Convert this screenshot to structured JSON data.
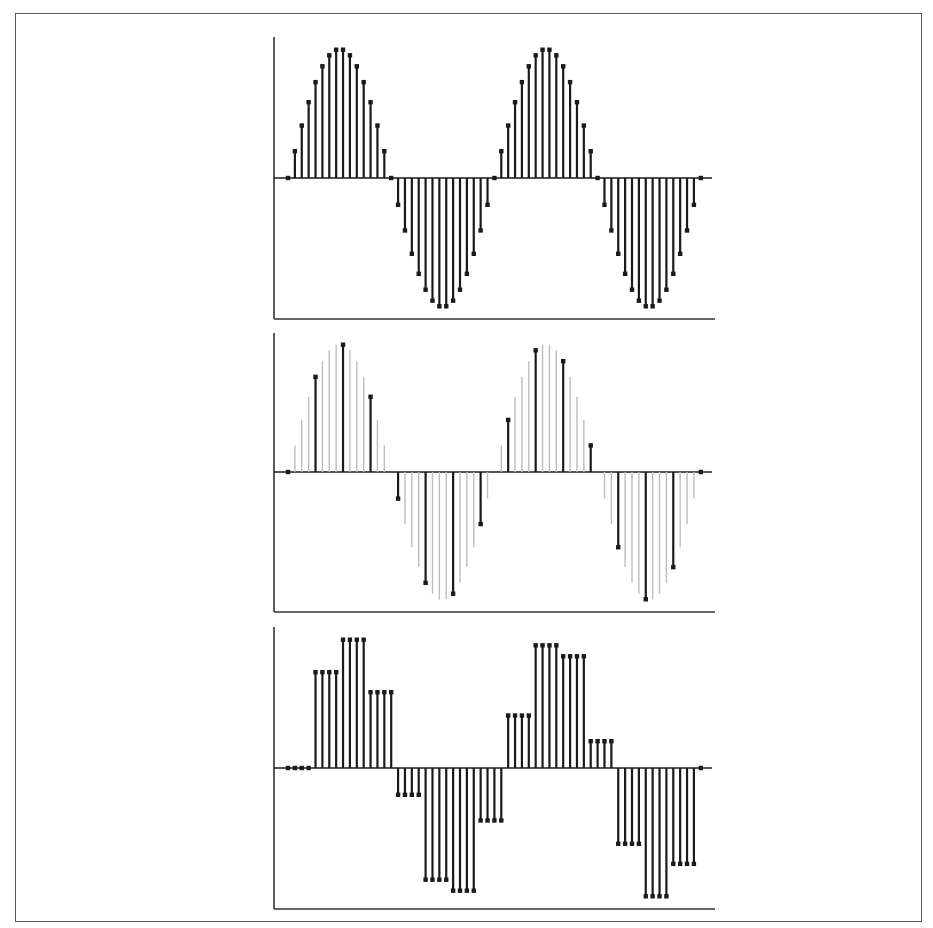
{
  "style": {
    "stem_color": "#1a1a1a",
    "ghost_color": "#bdbdbd",
    "axis_color": "#333333",
    "frame_color": "#555555"
  },
  "chart_data": [
    {
      "type": "stem",
      "title": "",
      "xlabel": "",
      "ylabel": "",
      "x_range": [
        0,
        60
      ],
      "ylim": [
        -1,
        1
      ],
      "samples_per_period": 30,
      "n_samples": 61,
      "formula": "sin(2*pi*n/30)",
      "values": [
        0,
        0.2079,
        0.4067,
        0.5878,
        0.7431,
        0.866,
        0.9511,
        0.9945,
        0.9945,
        0.9511,
        0.866,
        0.7431,
        0.5878,
        0.4067,
        0.2079,
        0,
        -0.2079,
        -0.4067,
        -0.5878,
        -0.7431,
        -0.866,
        -0.9511,
        -0.9945,
        -0.9945,
        -0.9511,
        -0.866,
        -0.7431,
        -0.5878,
        -0.4067,
        -0.2079,
        0,
        0.2079,
        0.4067,
        0.5878,
        0.7431,
        0.866,
        0.9511,
        0.9945,
        0.9945,
        0.9511,
        0.866,
        0.7431,
        0.5878,
        0.4067,
        0.2079,
        0,
        -0.2079,
        -0.4067,
        -0.5878,
        -0.7431,
        -0.866,
        -0.9511,
        -0.9945,
        -0.9945,
        -0.9511,
        -0.866,
        -0.7431,
        -0.5878,
        -0.4067,
        -0.2079,
        0
      ]
    },
    {
      "type": "stem",
      "title": "",
      "xlabel": "",
      "ylabel": "",
      "x_range": [
        0,
        60
      ],
      "ylim": [
        -1,
        1
      ],
      "downsample_factor": 4,
      "background_series": "original samples (light gray)",
      "highlighted_indices": [
        0,
        4,
        8,
        12,
        16,
        20,
        24,
        28,
        32,
        36,
        40,
        44,
        48,
        52,
        56,
        60
      ],
      "highlighted_values": [
        0,
        0.7431,
        0.9945,
        0.5878,
        -0.2079,
        -0.866,
        -0.9511,
        -0.4067,
        0.4067,
        0.9511,
        0.866,
        0.2079,
        -0.5878,
        -0.9945,
        -0.7431,
        0
      ]
    },
    {
      "type": "stem",
      "title": "",
      "xlabel": "",
      "ylabel": "",
      "x_range": [
        0,
        60
      ],
      "ylim": [
        -1,
        1
      ],
      "hold_length": 4,
      "values": [
        0,
        0,
        0,
        0,
        0.7431,
        0.7431,
        0.7431,
        0.7431,
        0.9945,
        0.9945,
        0.9945,
        0.9945,
        0.5878,
        0.5878,
        0.5878,
        0.5878,
        -0.2079,
        -0.2079,
        -0.2079,
        -0.2079,
        -0.866,
        -0.866,
        -0.866,
        -0.866,
        -0.9511,
        -0.9511,
        -0.9511,
        -0.9511,
        -0.4067,
        -0.4067,
        -0.4067,
        -0.4067,
        0.4067,
        0.4067,
        0.4067,
        0.4067,
        0.9511,
        0.9511,
        0.9511,
        0.9511,
        0.866,
        0.866,
        0.866,
        0.866,
        0.2079,
        0.2079,
        0.2079,
        0.2079,
        -0.5878,
        -0.5878,
        -0.5878,
        -0.5878,
        -0.9945,
        -0.9945,
        -0.9945,
        -0.9945,
        -0.7431,
        -0.7431,
        -0.7431,
        -0.7431,
        0
      ]
    }
  ],
  "layout": {
    "panels": [
      {
        "axis_left": 274,
        "axis_top": 37,
        "axis_bottom": 319,
        "axis_right": 715,
        "baseline_y": 178,
        "baseline_right": 712,
        "amplitude": 129
      },
      {
        "axis_left": 274,
        "axis_top": 333,
        "axis_bottom": 612,
        "axis_right": 715,
        "baseline_y": 472,
        "baseline_right": 712,
        "amplitude": 128
      },
      {
        "axis_left": 274,
        "axis_top": 627,
        "axis_bottom": 909,
        "axis_right": 715,
        "baseline_y": 768,
        "baseline_right": 712,
        "amplitude": 129
      }
    ],
    "x0": 288,
    "dx": 6.88
  }
}
